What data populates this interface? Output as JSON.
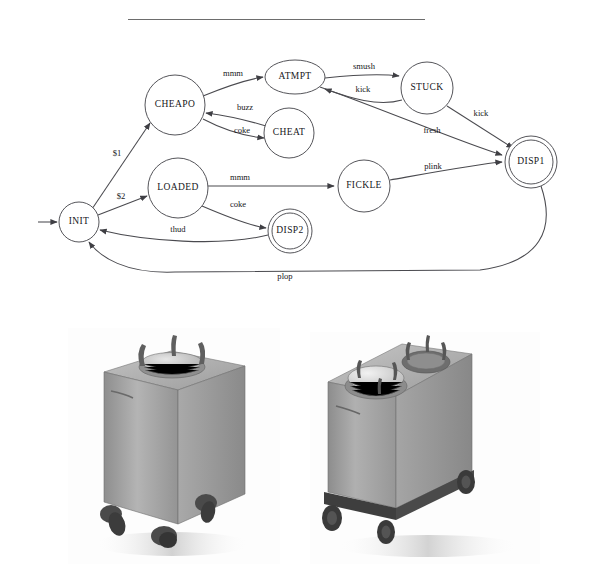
{
  "page": {
    "background_color": "#ffffff",
    "ink_color": "#16161a",
    "stroke_color": "#4a4a4f"
  },
  "top_rule": {
    "name": "horizontal-rule",
    "color": "#6d6d6d"
  },
  "diagram": {
    "type": "state-machine",
    "nodes": [
      {
        "id": "INIT",
        "label": "INIT",
        "shape": "circle",
        "accepting": false,
        "cx": 79,
        "cy": 188,
        "r": 20
      },
      {
        "id": "CHEAPO",
        "label": "CHEAPO",
        "shape": "circle",
        "accepting": false,
        "cx": 175,
        "cy": 71,
        "r": 30
      },
      {
        "id": "LOADED",
        "label": "LOADED",
        "shape": "circle",
        "accepting": false,
        "cx": 178,
        "cy": 154,
        "r": 30
      },
      {
        "id": "ATMPT",
        "label": "ATMPT",
        "shape": "ellipse",
        "accepting": false,
        "cx": 295,
        "cy": 43,
        "rx": 30,
        "ry": 17
      },
      {
        "id": "CHEAT",
        "label": "CHEAT",
        "shape": "circle",
        "accepting": false,
        "cx": 289,
        "cy": 99,
        "r": 25
      },
      {
        "id": "STUCK",
        "label": "STUCK",
        "shape": "circle",
        "accepting": false,
        "cx": 427,
        "cy": 54,
        "r": 26
      },
      {
        "id": "FICKLE",
        "label": "FICKLE",
        "shape": "circle",
        "accepting": false,
        "cx": 364,
        "cy": 152,
        "r": 26
      },
      {
        "id": "DISP1",
        "label": "DISP1",
        "shape": "double-circle",
        "accepting": true,
        "cx": 531,
        "cy": 128,
        "r": 22,
        "r_outer": 26
      },
      {
        "id": "DISP2",
        "label": "DISP2",
        "shape": "double-circle",
        "accepting": true,
        "cx": 290,
        "cy": 197,
        "r": 18,
        "r_outer": 22
      }
    ],
    "start_arrow": {
      "name": "start-arrow",
      "from_x": 40,
      "to_x": 58,
      "y": 188
    },
    "edges": [
      {
        "id": "init-cheapo",
        "from": "INIT",
        "to": "CHEAPO",
        "label": "$1"
      },
      {
        "id": "init-loaded",
        "from": "INIT",
        "to": "LOADED",
        "label": "$2"
      },
      {
        "id": "cheapo-atmpt",
        "from": "CHEAPO",
        "to": "ATMPT",
        "label": "mmm"
      },
      {
        "id": "cheat-cheapo",
        "from": "CHEAT",
        "to": "CHEAPO",
        "label": "buzz"
      },
      {
        "id": "cheapo-cheat",
        "from": "CHEAPO",
        "to": "CHEAT",
        "label": "coke"
      },
      {
        "id": "atmpt-stuck",
        "from": "ATMPT",
        "to": "STUCK",
        "label": "smush"
      },
      {
        "id": "stuck-atmpt",
        "from": "STUCK",
        "to": "ATMPT",
        "label": "kick"
      },
      {
        "id": "stuck-disp1",
        "from": "STUCK",
        "to": "DISP1",
        "label": "kick"
      },
      {
        "id": "atmpt-disp1",
        "from": "ATMPT",
        "to": "DISP1",
        "label": "fresh"
      },
      {
        "id": "loaded-fickle",
        "from": "LOADED",
        "to": "FICKLE",
        "label": "mmm"
      },
      {
        "id": "fickle-disp1",
        "from": "FICKLE",
        "to": "DISP1",
        "label": "plink"
      },
      {
        "id": "loaded-disp2",
        "from": "LOADED",
        "to": "DISP2",
        "label": "coke"
      },
      {
        "id": "disp2-init",
        "from": "DISP2",
        "to": "INIT",
        "label": "thud"
      },
      {
        "id": "disp1-init",
        "from": "DISP1",
        "to": "INIT",
        "label": "plop"
      }
    ],
    "labels": {
      "dollar_one": "$1",
      "dollar_two": "$2",
      "mmm_top": "mmm",
      "buzz": "buzz",
      "coke_top": "coke",
      "smush": "smush",
      "kick_back": "kick",
      "kick_disp": "kick",
      "fresh": "fresh",
      "mmm_bottom": "mmm",
      "plink": "plink",
      "coke_bottom": "coke",
      "thud": "thud",
      "plop": "plop"
    }
  },
  "photos": [
    {
      "id": "photo-left",
      "name": "plate-dispenser-single-photo",
      "caption": "",
      "description": "Single-stack mobile plate dispenser cabinet on casters",
      "body_color": "#a8a8a8",
      "shadow_color": "#c9c9c9"
    },
    {
      "id": "photo-right",
      "name": "plate-dispenser-double-photo",
      "caption": "",
      "description": "Two-stack mobile plate dispenser cabinet on a wheeled base",
      "body_color": "#a6a6a6",
      "shadow_color": "#c9c9c9"
    }
  ]
}
